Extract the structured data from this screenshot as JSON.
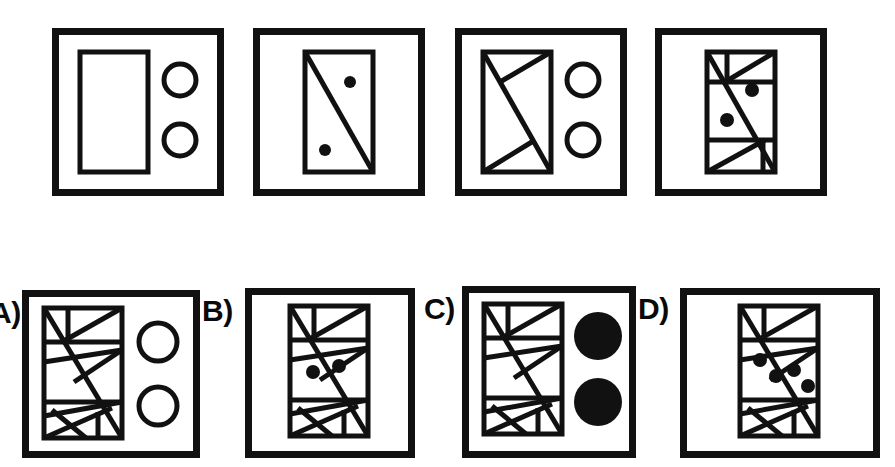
{
  "document": {
    "kind": "visual-analogy-puzzle",
    "title": "Abstract Reasoning Matrix Puzzle",
    "background_color": "#ffffff",
    "ink_color": "#111111",
    "stroke_width_outer_frame": 7,
    "stroke_width_inner_shape": 5,
    "rows": 2,
    "panels_per_row": 4
  },
  "sequence": {
    "name": "top-sequence",
    "count": 4,
    "panels": [
      {
        "id": "sequence-panel-1",
        "position": 1,
        "frame": {
          "x": 52,
          "y": 28,
          "width": 172,
          "height": 168
        },
        "shape": {
          "type": "rectangle",
          "fill": "none",
          "x": 28,
          "y": 24,
          "width": 68,
          "height": 120,
          "inner_lines": []
        },
        "markers": {
          "type": "circle-outline",
          "count": 2,
          "radius": 16,
          "filled": false,
          "positions": [
            [
              128,
              52
            ],
            [
              128,
              112
            ]
          ]
        },
        "dots": {
          "count": 0,
          "radius": 0,
          "positions": []
        }
      },
      {
        "id": "sequence-panel-2",
        "position": 2,
        "frame": {
          "x": 253,
          "y": 28,
          "width": 172,
          "height": 168
        },
        "shape": {
          "type": "rectangle",
          "fill": "none",
          "x": 52,
          "y": 24,
          "width": 68,
          "height": 120,
          "inner_lines": [
            "diagonal-tl-br"
          ]
        },
        "markers": {
          "type": "none",
          "count": 0,
          "radius": 0,
          "filled": false,
          "positions": []
        },
        "dots": {
          "count": 2,
          "radius": 6,
          "positions": [
            [
              97,
              54
            ],
            [
              72,
              122
            ]
          ]
        }
      },
      {
        "id": "sequence-panel-3",
        "position": 3,
        "frame": {
          "x": 455,
          "y": 28,
          "width": 172,
          "height": 168
        },
        "shape": {
          "type": "rectangle",
          "fill": "none",
          "x": 28,
          "y": 24,
          "width": 68,
          "height": 120,
          "inner_lines": [
            "diagonal-tl-br",
            "top-wedge",
            "bottom-wedge"
          ]
        },
        "markers": {
          "type": "circle-outline",
          "count": 2,
          "radius": 16,
          "filled": false,
          "positions": [
            [
              128,
              52
            ],
            [
              128,
              112
            ]
          ]
        },
        "dots": {
          "count": 0,
          "radius": 0,
          "positions": []
        }
      },
      {
        "id": "sequence-panel-4",
        "position": 4,
        "frame": {
          "x": 655,
          "y": 28,
          "width": 172,
          "height": 168
        },
        "shape": {
          "type": "rectangle",
          "fill": "none",
          "x": 52,
          "y": 24,
          "width": 68,
          "height": 120,
          "inner_lines": [
            "diagonal-tl-br",
            "top-band",
            "bottom-band",
            "band-diagonals"
          ]
        },
        "markers": {
          "type": "none",
          "count": 0,
          "radius": 0,
          "filled": false,
          "positions": []
        },
        "dots": {
          "count": 2,
          "radius": 7,
          "positions": [
            [
              97,
              62
            ],
            [
              72,
              92
            ]
          ]
        }
      }
    ]
  },
  "answer_options": {
    "name": "answer-options",
    "count": 4,
    "options": [
      {
        "id": "option-a",
        "label": "A)",
        "label_clipped_at_left_edge": true,
        "label_position": {
          "x": -10,
          "y": 298
        },
        "frame": {
          "x": 22,
          "y": 290,
          "width": 178,
          "height": 168
        },
        "shape": {
          "type": "rectangle",
          "fill": "none",
          "x": 22,
          "y": 18,
          "width": 78,
          "height": 130,
          "inner_lines": [
            "zigzag-full"
          ]
        },
        "markers": {
          "type": "circle-outline",
          "count": 2,
          "radius": 19,
          "filled": false,
          "positions": [
            [
              136,
              52
            ],
            [
              136,
              116
            ]
          ]
        },
        "dots": {
          "count": 0,
          "radius": 0,
          "positions": []
        }
      },
      {
        "id": "option-b",
        "label": "B)",
        "label_clipped_at_left_edge": false,
        "label_position": {
          "x": 202,
          "y": 296
        },
        "frame": {
          "x": 245,
          "y": 288,
          "width": 170,
          "height": 170
        },
        "shape": {
          "type": "rectangle",
          "fill": "none",
          "x": 45,
          "y": 18,
          "width": 78,
          "height": 130,
          "inner_lines": [
            "zigzag-full"
          ]
        },
        "markers": {
          "type": "none",
          "count": 0,
          "radius": 0,
          "filled": false,
          "positions": []
        },
        "dots": {
          "count": 2,
          "radius": 7,
          "positions": [
            [
              68,
              84
            ],
            [
              94,
              78
            ]
          ]
        }
      },
      {
        "id": "option-c",
        "label": "C)",
        "label_clipped_at_left_edge": false,
        "label_position": {
          "x": 424,
          "y": 294
        },
        "frame": {
          "x": 462,
          "y": 286,
          "width": 174,
          "height": 172
        },
        "shape": {
          "type": "rectangle",
          "fill": "none",
          "x": 22,
          "y": 18,
          "width": 78,
          "height": 130,
          "inner_lines": [
            "zigzag-full"
          ]
        },
        "markers": {
          "type": "circle-filled",
          "count": 2,
          "radius": 24,
          "filled": true,
          "positions": [
            [
              136,
              50
            ],
            [
              136,
              116
            ]
          ]
        },
        "dots": {
          "count": 0,
          "radius": 0,
          "positions": []
        }
      },
      {
        "id": "option-d",
        "label": "D)",
        "label_clipped_at_left_edge": false,
        "label_position": {
          "x": 638,
          "y": 294
        },
        "frame": {
          "x": 680,
          "y": 288,
          "width": 200,
          "height": 170
        },
        "shape": {
          "type": "rectangle",
          "fill": "none",
          "x": 60,
          "y": 18,
          "width": 78,
          "height": 130,
          "inner_lines": [
            "zigzag-full"
          ]
        },
        "markers": {
          "type": "none",
          "count": 0,
          "radius": 0,
          "filled": false,
          "positions": []
        },
        "dots": {
          "count": 4,
          "radius": 7,
          "positions": [
            [
              80,
              72
            ],
            [
              96,
              88
            ],
            [
              114,
              82
            ],
            [
              128,
              98
            ]
          ]
        }
      }
    ]
  }
}
